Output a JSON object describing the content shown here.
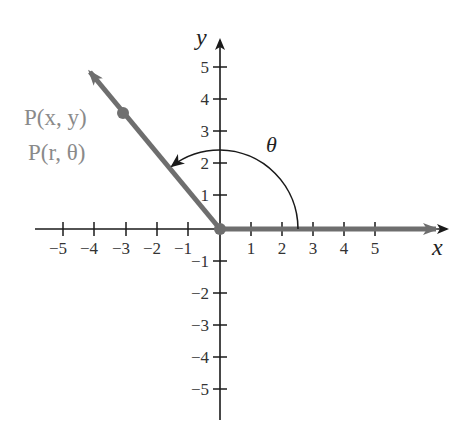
{
  "diagram": {
    "type": "polar-angle-diagram",
    "axes": {
      "x_label": "x",
      "y_label": "y",
      "x_ticks": [
        "−5",
        "−4",
        "−3",
        "−2",
        "−1",
        "1",
        "2",
        "3",
        "4",
        "5"
      ],
      "y_ticks_positive": [
        "5",
        "4",
        "3",
        "2",
        "1"
      ],
      "y_ticks_negative": [
        "−1",
        "−2",
        "−3",
        "−4",
        "−5"
      ],
      "x_range": [
        -5,
        5
      ],
      "y_range": [
        -5,
        5
      ]
    },
    "point": {
      "label_cartesian": "P(x, y)",
      "label_polar": "P(r, θ)",
      "coords": [
        -3,
        3.5
      ]
    },
    "angle": {
      "label": "θ",
      "initial_side": "positive x-axis",
      "terminal_side": "ray through P",
      "arc_radius": 2.5
    },
    "colors": {
      "axis": "#1a1a1a",
      "ray": "#6e6e6e",
      "point": "#707070",
      "point_label": "#8a8a8a"
    }
  }
}
